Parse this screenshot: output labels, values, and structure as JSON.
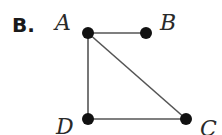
{
  "option": {
    "label": "B."
  },
  "graph": {
    "vertices": [
      {
        "id": "A",
        "label": "A",
        "x": 88,
        "y": 33,
        "label_x": 55,
        "label_y": 30
      },
      {
        "id": "B",
        "label": "B",
        "x": 146,
        "y": 33,
        "label_x": 160,
        "label_y": 30
      },
      {
        "id": "C",
        "label": "C",
        "x": 186,
        "y": 119,
        "label_x": 200,
        "label_y": 136
      },
      {
        "id": "D",
        "label": "D",
        "x": 88,
        "y": 119,
        "label_x": 56,
        "label_y": 134
      }
    ],
    "edges": [
      {
        "from": "A",
        "to": "B"
      },
      {
        "from": "A",
        "to": "D"
      },
      {
        "from": "A",
        "to": "C"
      },
      {
        "from": "D",
        "to": "C"
      }
    ],
    "colors": {
      "edge": "#555555",
      "vertex": "#111111",
      "text": "#2a2a2a"
    }
  }
}
